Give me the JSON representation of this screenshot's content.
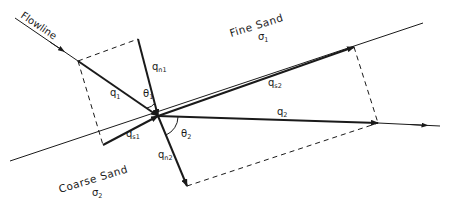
{
  "diagram": {
    "type": "refraction of flowlines across a boundary between two media",
    "labels": {
      "flowline": "Flowline",
      "upper_medium": "Fine Sand",
      "upper_sigma": "σ",
      "upper_sigma_sub": "1",
      "lower_medium": "Coarse Sand",
      "lower_sigma": "σ",
      "lower_sigma_sub": "2",
      "q1": "q",
      "q1_sub": "1",
      "qn1": "q",
      "qn1_sub": "n1",
      "qs1": "q",
      "qs1_sub": "s1",
      "theta1": "θ",
      "theta1_sub": "1",
      "q2": "q",
      "q2_sub": "2",
      "qs2": "q",
      "qs2_sub": "s2",
      "qn2": "q",
      "qn2_sub": "n2",
      "theta2": "θ",
      "theta2_sub": "2"
    },
    "colors": {
      "line": "#1a1a1a",
      "background": "#ffffff"
    }
  }
}
